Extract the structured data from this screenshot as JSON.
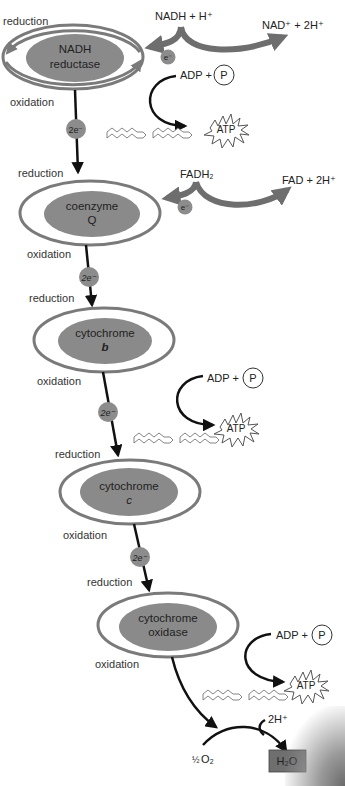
{
  "diagram": {
    "colors": {
      "enzyme_fill": "#8a8a8a",
      "ring_stroke": "#7a7a7a",
      "arrow": "#111111",
      "thick_arrow": "#6e6e6e",
      "electron_ball": "#8c8c8c",
      "water_box": "#6f6f6f"
    },
    "carriers": [
      {
        "name_line1": "NADH",
        "name_line2": "reductase",
        "reduction": "reduction",
        "oxidation": "oxidation"
      },
      {
        "name_line1": "coenzyme",
        "name_line2": "Q",
        "reduction": "reduction",
        "oxidation": "oxidation"
      },
      {
        "name_line1": "cytochrome",
        "name_line2": "b",
        "reduction": "reduction",
        "oxidation": "oxidation"
      },
      {
        "name_line1": "cytochrome",
        "name_line2": "c",
        "reduction": "reduction",
        "oxidation": "oxidation"
      },
      {
        "name_line1": "cytochrome",
        "name_line2": "oxidase",
        "reduction": "reduction",
        "oxidation": "oxidation"
      }
    ],
    "electron_labels": {
      "two": "2e⁻",
      "one": "e⁻"
    },
    "inputs": {
      "nadh": "NADH + H⁺",
      "nad": "NAD⁺ + 2H⁺",
      "fadh2": "FADH₂",
      "fad": "FAD + 2H⁺"
    },
    "atp_sites": [
      {
        "adp": "ADP +",
        "p": "P",
        "atp": "ATP"
      },
      {
        "adp": "ADP +",
        "p": "P",
        "atp": "ATP"
      },
      {
        "adp": "ADP +",
        "p": "P",
        "atp": "ATP"
      }
    ],
    "final": {
      "oxygen_frac": "½",
      "oxygen": "O₂",
      "protons": "2H⁺",
      "water": "H₂O"
    }
  }
}
